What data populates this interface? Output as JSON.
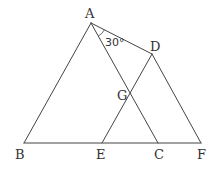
{
  "diagram": {
    "title": "",
    "points": {
      "A": {
        "label": "A",
        "x": 91,
        "y": 23
      },
      "B": {
        "label": "B",
        "x": 24,
        "y": 143
      },
      "C": {
        "label": "C",
        "x": 158,
        "y": 143
      },
      "D": {
        "label": "D",
        "x": 152,
        "y": 54
      },
      "E": {
        "label": "E",
        "x": 102,
        "y": 143
      },
      "F": {
        "label": "F",
        "x": 201,
        "y": 143
      },
      "G": {
        "label": "G",
        "x": 130,
        "y": 95
      }
    },
    "segments": [
      [
        "A",
        "B"
      ],
      [
        "A",
        "C"
      ],
      [
        "A",
        "D"
      ],
      [
        "D",
        "E"
      ],
      [
        "D",
        "F"
      ],
      [
        "B",
        "F"
      ]
    ],
    "angle_annotation": {
      "vertex": "A",
      "between": [
        "C",
        "D"
      ],
      "text": "30°"
    }
  }
}
